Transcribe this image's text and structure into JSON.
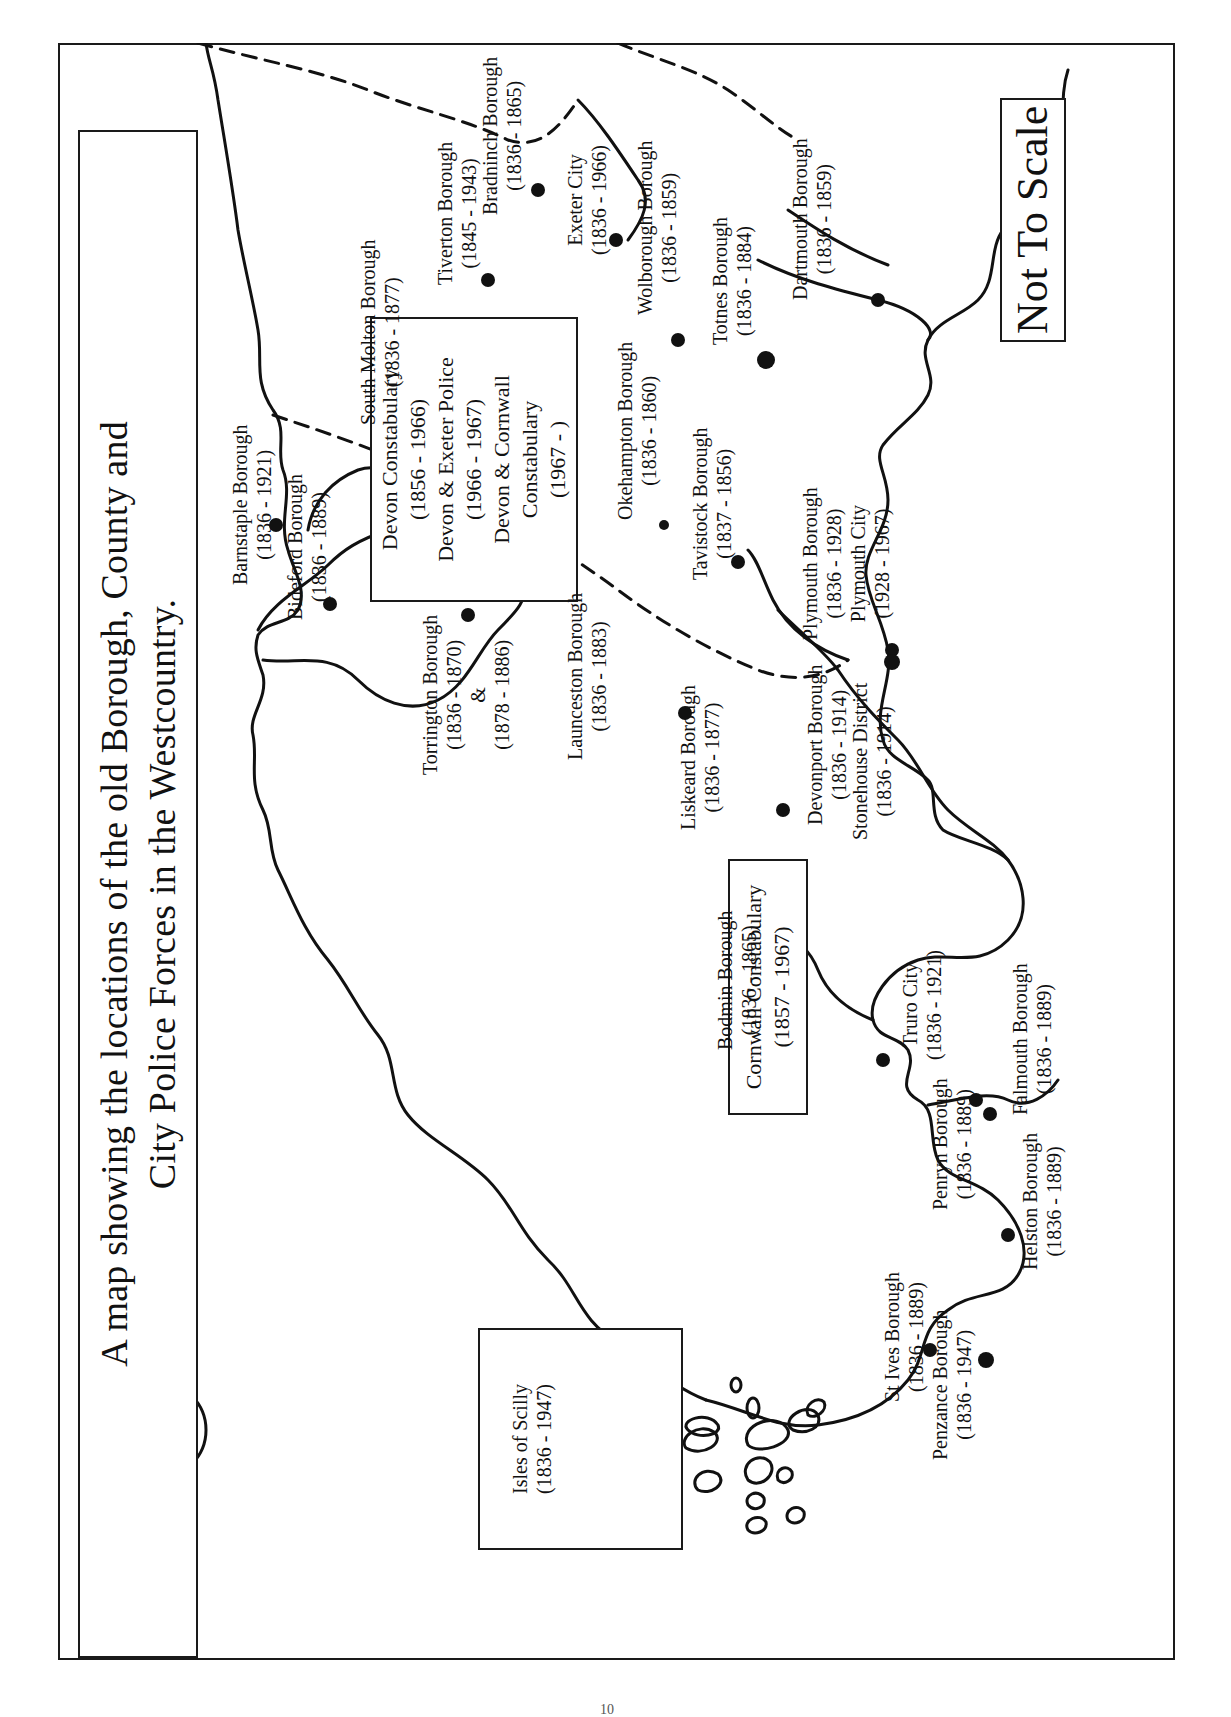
{
  "title": {
    "line1": "A map showing the locations of the old Borough, County and",
    "line2": "City Police Forces in the Westcountry."
  },
  "not_to_scale": "Not To Scale",
  "compass": {
    "icon": "north-arrow-icon",
    "letter": "N"
  },
  "county_forces": {
    "devon": {
      "lines": [
        "Devon Constabulary",
        "(1856 - 1966)",
        "Devon & Exeter Police",
        "(1966 - 1967)",
        "Devon & Cornwall",
        "Constabulary",
        "(1967 -        )"
      ]
    },
    "cornwall": {
      "lines": [
        "Cornwall Constabulary",
        "(1857 - 1967)"
      ]
    },
    "scilly": {
      "lines": [
        "Isles of Scilly",
        "(1836 - 1947)"
      ]
    }
  },
  "places": [
    {
      "name": "Barnstaple Borough",
      "dates": "(1836 - 1921)"
    },
    {
      "name": "Bideford Borough",
      "dates": "(1836 - 1889)"
    },
    {
      "name": "South Molton Borough",
      "dates": "(1836 - 1877)"
    },
    {
      "name": "Tiverton Borough",
      "dates": "(1845 - 1943)"
    },
    {
      "name": "Bradninch Borough",
      "dates": "(1836 - 1865)"
    },
    {
      "name": "Exeter City",
      "dates": "(1836 - 1966)"
    },
    {
      "name": "Wolborough Borough",
      "dates": "(1836 - 1859)"
    },
    {
      "name": "Totnes Borough",
      "dates": "(1836 - 1884)"
    },
    {
      "name": "Dartmouth Borough",
      "dates": "(1836 - 1859)"
    },
    {
      "name": "Okehampton Borough",
      "dates": "(1836 - 1860)"
    },
    {
      "name": "Tavistock Borough",
      "dates": "(1837 - 1856)"
    },
    {
      "name": "Plymouth Borough",
      "dates": "(1836 - 1928)",
      "extra_name": "Plymouth City",
      "extra_dates": "(1928 - 1967)"
    },
    {
      "name": "Devonport Borough",
      "dates": "(1836 - 1914)"
    },
    {
      "name": "Stonehouse District",
      "dates": "(1836 - 1914)"
    },
    {
      "name": "Torrington Borough",
      "dates": "(1836 - 1870)",
      "extra_name": "&",
      "extra_dates": "(1878 - 1886)"
    },
    {
      "name": "Launceston Borough",
      "dates": "(1836 - 1883)"
    },
    {
      "name": "Liskeard Borough",
      "dates": "(1836 - 1877)"
    },
    {
      "name": "Bodmin Borough",
      "dates": "(1836 - 1865)"
    },
    {
      "name": "Truro City",
      "dates": "(1836 - 1921)"
    },
    {
      "name": "Penryn Borough",
      "dates": "(1836 - 1889)"
    },
    {
      "name": "Falmouth Borough",
      "dates": "(1836 - 1889)"
    },
    {
      "name": "Helston Borough",
      "dates": "(1836 - 1889)"
    },
    {
      "name": "St Ives Borough",
      "dates": "(1836 - 1889)"
    },
    {
      "name": "Penzance Borough",
      "dates": "(1836 - 1947)"
    }
  ],
  "page_number": "10"
}
